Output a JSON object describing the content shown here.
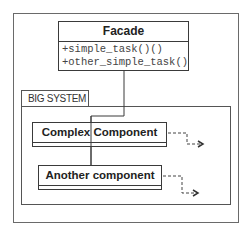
{
  "facade": {
    "title": "Facade",
    "methods": [
      "+simple_task()()",
      "+other_simple_task()"
    ]
  },
  "package": {
    "label": "BIG SYSTEM",
    "components": [
      {
        "name": "Complex Component"
      },
      {
        "name": "Another component"
      }
    ]
  },
  "colors": {
    "line": "#3a3a3a",
    "frame": "#6a6a6a",
    "background": "#ffffff"
  }
}
